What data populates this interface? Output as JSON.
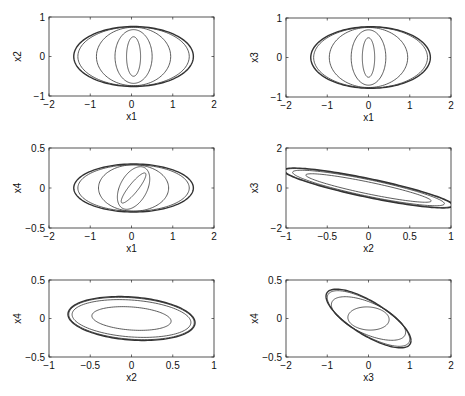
{
  "figure": {
    "width": 465,
    "height": 396,
    "background": "#ffffff",
    "line_color": "#333333"
  },
  "chart_data": [
    {
      "type": "line",
      "name": "x1-x2 phase portrait",
      "xlabel": "x1",
      "ylabel": "x2",
      "xlim": [
        -2,
        2
      ],
      "ylim": [
        -1,
        1
      ],
      "xticks": [
        -2,
        -1,
        0,
        1,
        2
      ],
      "yticks": [
        -1,
        0,
        1
      ],
      "xticklabels": [
        "−2",
        "−1",
        "0",
        "1",
        "2"
      ],
      "yticklabels": [
        "−1",
        "0",
        "1"
      ],
      "grid": false,
      "box": {
        "left": 49,
        "top": 17,
        "right": 214,
        "bottom": 96
      },
      "series": [
        {
          "name": "orbit-1",
          "cx": 0.05,
          "cy": 0.0,
          "a": 0.17,
          "b": 0.5,
          "angle_deg": 0,
          "width": 0.8
        },
        {
          "name": "orbit-2",
          "cx": 0.05,
          "cy": 0.0,
          "a": 0.45,
          "b": 0.68,
          "angle_deg": 0,
          "width": 0.8
        },
        {
          "name": "orbit-3",
          "cx": 0.05,
          "cy": 0.0,
          "a": 0.9,
          "b": 0.74,
          "angle_deg": 0,
          "width": 0.8
        },
        {
          "name": "orbit-4",
          "cx": 0.05,
          "cy": 0.0,
          "a": 1.35,
          "b": 0.75,
          "angle_deg": 0,
          "width": 0.8
        },
        {
          "name": "orbit-5",
          "cx": 0.05,
          "cy": 0.0,
          "a": 1.45,
          "b": 0.76,
          "angle_deg": 0,
          "width": 1.4
        }
      ]
    },
    {
      "type": "line",
      "name": "x1-x3 phase portrait",
      "xlabel": "x1",
      "ylabel": "x3",
      "xlim": [
        -2,
        2
      ],
      "ylim": [
        -1,
        1
      ],
      "xticks": [
        -2,
        -1,
        0,
        1,
        2
      ],
      "yticks": [
        -1,
        0,
        1
      ],
      "xticklabels": [
        "−2",
        "−1",
        "0",
        "1",
        "2"
      ],
      "yticklabels": [
        "−1",
        "0",
        "1"
      ],
      "grid": false,
      "box": {
        "left": 286,
        "top": 18,
        "right": 451,
        "bottom": 97
      },
      "series": [
        {
          "name": "orbit-1",
          "cx": 0.0,
          "cy": 0.0,
          "a": 0.15,
          "b": 0.5,
          "angle_deg": 0,
          "width": 0.8
        },
        {
          "name": "orbit-2",
          "cx": 0.0,
          "cy": 0.0,
          "a": 0.42,
          "b": 0.7,
          "angle_deg": 0,
          "width": 0.8
        },
        {
          "name": "orbit-3",
          "cx": 0.0,
          "cy": 0.0,
          "a": 0.95,
          "b": 0.76,
          "angle_deg": 0,
          "width": 0.8
        },
        {
          "name": "orbit-4",
          "cx": 0.05,
          "cy": 0.0,
          "a": 1.38,
          "b": 0.77,
          "angle_deg": 0,
          "width": 0.8
        },
        {
          "name": "orbit-5",
          "cx": 0.05,
          "cy": 0.0,
          "a": 1.45,
          "b": 0.78,
          "angle_deg": 0,
          "width": 1.4
        }
      ]
    },
    {
      "type": "line",
      "name": "x1-x4 phase portrait",
      "xlabel": "x1",
      "ylabel": "x4",
      "xlim": [
        -2,
        2
      ],
      "ylim": [
        -0.5,
        0.5
      ],
      "xticks": [
        -2,
        -1,
        0,
        1,
        2
      ],
      "yticks": [
        -0.5,
        0,
        0.5
      ],
      "xticklabels": [
        "−2",
        "−1",
        "0",
        "1",
        "2"
      ],
      "yticklabels": [
        "−0.5",
        "0",
        "0.5"
      ],
      "grid": false,
      "box": {
        "left": 49,
        "top": 148,
        "right": 214,
        "bottom": 228
      },
      "series": [
        {
          "name": "orbit-1",
          "cx": 0.05,
          "cy": 0.0,
          "a": 0.13,
          "b": 0.2,
          "angle_deg": -20,
          "width": 0.8
        },
        {
          "name": "orbit-2",
          "cx": 0.05,
          "cy": 0.0,
          "a": 0.35,
          "b": 0.27,
          "angle_deg": -10,
          "width": 0.8
        },
        {
          "name": "orbit-3",
          "cx": 0.05,
          "cy": 0.0,
          "a": 0.85,
          "b": 0.29,
          "angle_deg": 0,
          "width": 0.8
        },
        {
          "name": "orbit-4",
          "cx": 0.05,
          "cy": 0.0,
          "a": 1.35,
          "b": 0.29,
          "angle_deg": 0,
          "width": 0.8
        },
        {
          "name": "orbit-5",
          "cx": 0.05,
          "cy": 0.0,
          "a": 1.45,
          "b": 0.3,
          "angle_deg": 0,
          "width": 1.4
        }
      ]
    },
    {
      "type": "line",
      "name": "x2-x3 phase portrait",
      "xlabel": "x2",
      "ylabel": "x3",
      "xlim": [
        -1,
        1
      ],
      "ylim": [
        -2,
        2
      ],
      "xticks": [
        -1,
        -0.5,
        0,
        0.5,
        1
      ],
      "yticks": [
        -2,
        0,
        2
      ],
      "xticklabels": [
        "−1",
        "−0.5",
        "0",
        "0.5",
        "1"
      ],
      "yticklabels": [
        "−2",
        "0",
        "2"
      ],
      "grid": false,
      "box": {
        "left": 286,
        "top": 148,
        "right": 451,
        "bottom": 228
      },
      "series": [
        {
          "name": "orbit-1",
          "cx": 0.0,
          "cy": 0.0,
          "slope": -1.0,
          "u": 0.76,
          "v": 0.3,
          "width": 0.8
        },
        {
          "name": "orbit-2",
          "cx": 0.0,
          "cy": 0.0,
          "slope": -1.0,
          "u": 0.92,
          "v": 0.42,
          "width": 0.8
        },
        {
          "name": "orbit-3",
          "cx": 0.0,
          "cy": 0.0,
          "slope": -1.0,
          "u": 1.01,
          "v": 0.46,
          "width": 0.8
        },
        {
          "name": "orbit-4",
          "cx": 0.0,
          "cy": 0.0,
          "slope": -1.0,
          "u": 1.03,
          "v": 0.48,
          "width": 1.4
        }
      ]
    },
    {
      "type": "line",
      "name": "x2-x4 phase portrait",
      "xlabel": "x2",
      "ylabel": "x4",
      "xlim": [
        -1,
        1
      ],
      "ylim": [
        -0.5,
        0.5
      ],
      "xticks": [
        -1,
        -0.5,
        0,
        0.5,
        1
      ],
      "yticks": [
        -0.5,
        0,
        0.5
      ],
      "xticklabels": [
        "−1",
        "−0.5",
        "0",
        "0.5",
        "1"
      ],
      "yticklabels": [
        "−0.5",
        "0",
        "0.5"
      ],
      "grid": false,
      "box": {
        "left": 49,
        "top": 280,
        "right": 214,
        "bottom": 357
      },
      "series": [
        {
          "name": "orbit-1",
          "cx": 0.0,
          "cy": 0.0,
          "slope": -0.05,
          "u": 0.48,
          "v": 0.15,
          "width": 0.8
        },
        {
          "name": "orbit-2",
          "cx": 0.0,
          "cy": 0.0,
          "slope": -0.12,
          "u": 0.72,
          "v": 0.24,
          "width": 0.8
        },
        {
          "name": "orbit-3",
          "cx": 0.0,
          "cy": 0.0,
          "slope": -0.15,
          "u": 0.76,
          "v": 0.27,
          "width": 0.8
        },
        {
          "name": "orbit-4",
          "cx": 0.0,
          "cy": 0.0,
          "slope": -0.16,
          "u": 0.77,
          "v": 0.28,
          "width": 1.4
        }
      ]
    },
    {
      "type": "line",
      "name": "x3-x4 phase portrait",
      "xlabel": "x3",
      "ylabel": "x4",
      "xlim": [
        -2,
        2
      ],
      "ylim": [
        -0.5,
        0.5
      ],
      "xticks": [
        -2,
        -1,
        0,
        1,
        2
      ],
      "yticks": [
        -0.5,
        0,
        0.5
      ],
      "xticklabels": [
        "−2",
        "−1",
        "0",
        "1",
        "2"
      ],
      "yticklabels": [
        "−0.5",
        "0",
        "0.5"
      ],
      "grid": false,
      "box": {
        "left": 286,
        "top": 280,
        "right": 451,
        "bottom": 357
      },
      "series": [
        {
          "name": "orbit-1",
          "cx": 0.0,
          "cy": 0.0,
          "slope": -0.03,
          "u": 0.5,
          "v": 0.15,
          "width": 0.8
        },
        {
          "name": "orbit-2",
          "cx": 0.0,
          "cy": 0.0,
          "slope": -0.22,
          "u": 0.9,
          "v": 0.22,
          "width": 0.8
        },
        {
          "name": "orbit-3",
          "cx": 0.0,
          "cy": 0.0,
          "slope": -0.3,
          "u": 1.0,
          "v": 0.24,
          "width": 0.8
        },
        {
          "name": "orbit-4",
          "cx": 0.0,
          "cy": 0.0,
          "slope": -0.31,
          "u": 1.03,
          "v": 0.25,
          "width": 1.4
        }
      ]
    }
  ]
}
